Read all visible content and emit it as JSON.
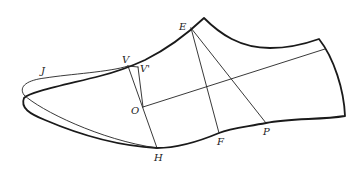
{
  "diagram": {
    "points": [
      {
        "id": "J",
        "label": "J",
        "x": 45,
        "y": 78,
        "lx": 41,
        "ly": 74
      },
      {
        "id": "V",
        "label": "V",
        "x": 128,
        "y": 66,
        "lx": 122,
        "ly": 63
      },
      {
        "id": "Vp",
        "label": "V'",
        "x": 138,
        "y": 67,
        "lx": 140,
        "ly": 72
      },
      {
        "id": "O",
        "label": "O",
        "x": 143,
        "y": 107,
        "lx": 131,
        "ly": 114
      },
      {
        "id": "H",
        "label": "H",
        "x": 157,
        "y": 148,
        "lx": 154,
        "ly": 161
      },
      {
        "id": "E",
        "label": "E",
        "x": 191,
        "y": 28,
        "lx": 179,
        "ly": 30
      },
      {
        "id": "F",
        "label": "F",
        "x": 219,
        "y": 133,
        "lx": 217,
        "ly": 145
      },
      {
        "id": "P",
        "label": "P",
        "x": 266,
        "y": 123,
        "lx": 263,
        "ly": 135
      }
    ],
    "segments": [
      {
        "from": "V",
        "to": "H"
      },
      {
        "from": "Vp",
        "to": "O"
      },
      {
        "from": "V",
        "to": "Vp"
      },
      {
        "from": "E",
        "to": "F"
      },
      {
        "from": "E",
        "to": "P"
      },
      {
        "from": "O",
        "to": "heel-axis-end"
      }
    ],
    "colors": {
      "stroke": "#1a1a1a",
      "background": "#ffffff"
    }
  }
}
